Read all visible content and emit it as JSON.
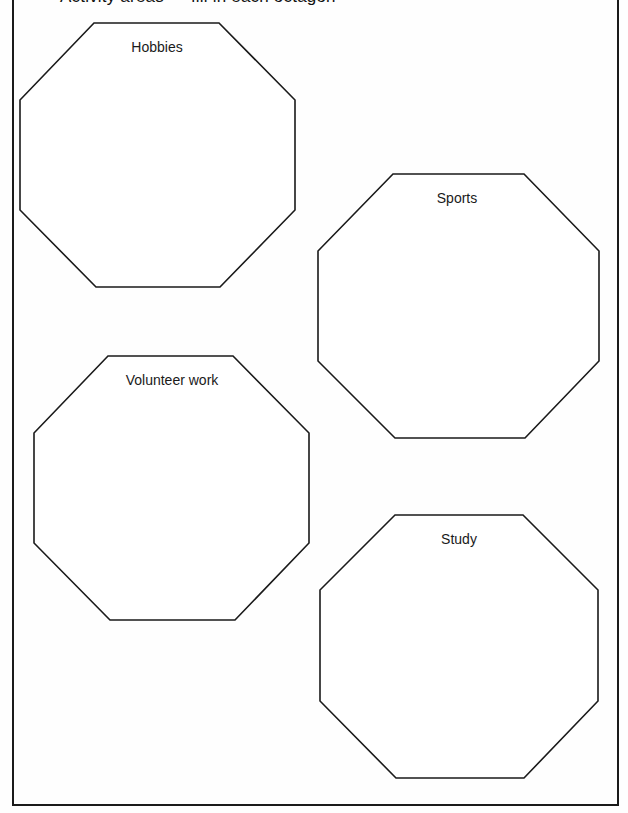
{
  "page": {
    "heading_partial": "Activity areas — fill in each octagon",
    "background": "#fefefe",
    "line_color": "#1a1a1a"
  },
  "octagons": [
    {
      "label": "Hobbies",
      "points": "94,23 219,23 295,100 295,210 220,287 96,287 20,210 20,100",
      "label_x": 157,
      "label_y": 39
    },
    {
      "label": "Sports",
      "points": "393,174 524,174 599,251 599,361 525,438 395,438 318,361 318,251",
      "label_x": 457,
      "label_y": 190
    },
    {
      "label": "Volunteer work",
      "points": "108,356 233,356 309,433 309,543 235,620 110,620 34,543 34,433",
      "label_x": 172,
      "label_y": 372
    },
    {
      "label": "Study",
      "points": "395,515 523,515 598,590 598,701 524,778 396,778 320,701 320,590",
      "label_x": 459,
      "label_y": 531
    }
  ]
}
